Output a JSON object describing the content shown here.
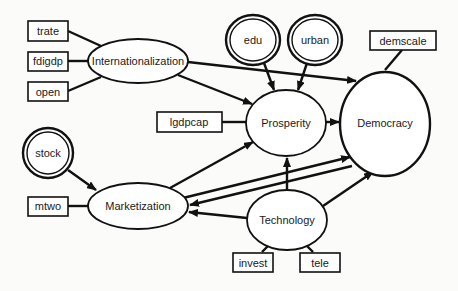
{
  "diagram": {
    "type": "path-model",
    "nodes": {
      "trate": {
        "label": "trate",
        "shape": "box"
      },
      "fdigdp": {
        "label": "fdigdp",
        "shape": "box"
      },
      "open": {
        "label": "open",
        "shape": "box"
      },
      "internationalization": {
        "label": "Internationalization",
        "shape": "ellipse"
      },
      "lgdpcap": {
        "label": "lgdpcap",
        "shape": "box"
      },
      "edu": {
        "label": "edu",
        "shape": "double-circle"
      },
      "urban": {
        "label": "urban",
        "shape": "double-circle"
      },
      "demscale": {
        "label": "demscale",
        "shape": "box"
      },
      "prosperity": {
        "label": "Prosperity",
        "shape": "ellipse"
      },
      "democracy": {
        "label": "Democracy",
        "shape": "ellipse"
      },
      "stock": {
        "label": "stock",
        "shape": "double-circle"
      },
      "mtwo": {
        "label": "mtwo",
        "shape": "box"
      },
      "marketization": {
        "label": "Marketization",
        "shape": "ellipse"
      },
      "technology": {
        "label": "Technology",
        "shape": "ellipse"
      },
      "invest": {
        "label": "invest",
        "shape": "box"
      },
      "tele": {
        "label": "tele",
        "shape": "box"
      }
    },
    "edges": [
      {
        "from": "trate",
        "to": "internationalization",
        "directed": false
      },
      {
        "from": "fdigdp",
        "to": "internationalization",
        "directed": false
      },
      {
        "from": "open",
        "to": "internationalization",
        "directed": false
      },
      {
        "from": "internationalization",
        "to": "democracy",
        "directed": true
      },
      {
        "from": "internationalization",
        "to": "prosperity",
        "directed": true
      },
      {
        "from": "edu",
        "to": "prosperity",
        "directed": true
      },
      {
        "from": "urban",
        "to": "prosperity",
        "directed": true
      },
      {
        "from": "lgdpcap",
        "to": "prosperity",
        "directed": false
      },
      {
        "from": "demscale",
        "to": "democracy",
        "directed": false
      },
      {
        "from": "prosperity",
        "to": "democracy",
        "directed": true
      },
      {
        "from": "stock",
        "to": "marketization",
        "directed": true
      },
      {
        "from": "mtwo",
        "to": "marketization",
        "directed": false
      },
      {
        "from": "marketization",
        "to": "prosperity",
        "directed": true
      },
      {
        "from": "marketization",
        "to": "democracy",
        "directed": true
      },
      {
        "from": "democracy",
        "to": "marketization",
        "directed": true
      },
      {
        "from": "technology",
        "to": "marketization",
        "directed": true
      },
      {
        "from": "technology",
        "to": "prosperity",
        "directed": true
      },
      {
        "from": "technology",
        "to": "democracy",
        "directed": true
      },
      {
        "from": "invest",
        "to": "technology",
        "directed": false
      },
      {
        "from": "tele",
        "to": "technology",
        "directed": false
      }
    ]
  }
}
